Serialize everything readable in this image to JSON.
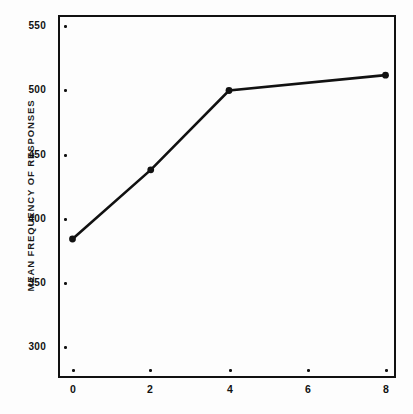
{
  "chart_data": {
    "type": "line",
    "title": "",
    "subtitle": "",
    "xlabel": "",
    "ylabel": "MEAN FREQUENCY OF RESPONSES",
    "x": [
      0,
      2,
      4,
      8
    ],
    "values": [
      384,
      438,
      500,
      512
    ],
    "series": [
      {
        "name": "mean frequency of responses",
        "x": [
          0,
          2,
          4,
          8
        ],
        "values": [
          384,
          438,
          500,
          512
        ]
      }
    ],
    "xticks": [
      0,
      2,
      4,
      6,
      8
    ],
    "xtick_labels": [
      "0",
      "2",
      "4",
      "6",
      "8"
    ],
    "yticks": [
      300,
      350,
      400,
      450,
      500,
      550
    ],
    "ytick_labels": [
      "300",
      "350",
      "400",
      "450",
      "500",
      "550"
    ],
    "xlim": [
      -0.4,
      8.5
    ],
    "ylim": [
      281,
      557
    ],
    "grid": false,
    "legend": "none",
    "marker": "filled-circle",
    "line_color": "#111111",
    "marker_color": "#111111",
    "background_color": "#ffffff",
    "frame_color": "#111111"
  },
  "figure": {
    "caption_fragment": ""
  }
}
